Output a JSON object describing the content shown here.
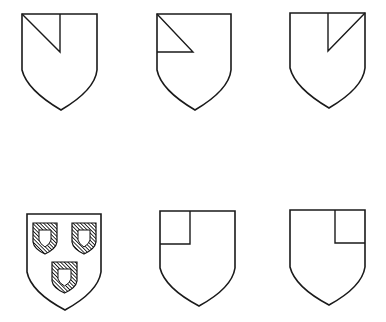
{
  "figure": {
    "colors": {
      "line": "#1a1a1a",
      "background": "#ffffff"
    },
    "shields": [
      {
        "id": "gyron-dexter-chief-vertical",
        "row": 1,
        "col": 1,
        "charge": "gyron (diagonal + vertical line in dexter chief)"
      },
      {
        "id": "gyron-dexter-chief-horizontal",
        "row": 1,
        "col": 2,
        "charge": "gyron (diagonal + horizontal line in dexter chief)"
      },
      {
        "id": "gyron-sinister-chief",
        "row": 1,
        "col": 3,
        "charge": "gyron (diagonal + vertical line in sinister chief)"
      },
      {
        "id": "three-escutcheons",
        "row": 2,
        "col": 1,
        "charge": "three hatched inescutcheons, two and one"
      },
      {
        "id": "canton-dexter",
        "row": 2,
        "col": 2,
        "charge": "canton in dexter chief"
      },
      {
        "id": "canton-sinister",
        "row": 2,
        "col": 3,
        "charge": "canton in sinister chief"
      }
    ]
  }
}
